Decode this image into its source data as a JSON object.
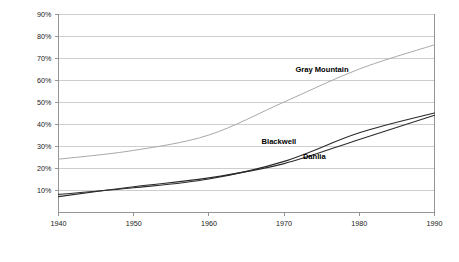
{
  "chart_data": {
    "type": "line",
    "title": "",
    "xlabel": "",
    "ylabel": "",
    "x": [
      1940,
      1950,
      1960,
      1970,
      1980,
      1990
    ],
    "xlim": [
      1940,
      1990
    ],
    "ylim": [
      0,
      90
    ],
    "xticks": [
      "1940",
      "1950",
      "1960",
      "1970",
      "1980",
      "1990"
    ],
    "yticks": [
      "10%",
      "20%",
      "30%",
      "40%",
      "50%",
      "60%",
      "70%",
      "80%",
      "90%"
    ],
    "ytick_values": [
      10,
      20,
      30,
      40,
      50,
      60,
      70,
      80,
      90
    ],
    "grid": true,
    "legend_position": "inline-annotations",
    "series": [
      {
        "name": "Gray Mountain",
        "color": "#a8a8a8",
        "values": [
          24,
          28,
          35,
          50,
          65,
          76
        ]
      },
      {
        "name": "Blackwell",
        "color": "#2b2b2b",
        "values": [
          8,
          11,
          15,
          23,
          36,
          45
        ]
      },
      {
        "name": "Dahlia",
        "color": "#2b2b2b",
        "values": [
          7,
          11.5,
          15.5,
          22,
          33,
          44
        ]
      }
    ],
    "annotations": [
      {
        "text": "Gray Mountain",
        "x": 1971.5,
        "y": 63.5
      },
      {
        "text": "Blackwell",
        "x": 1967.0,
        "y": 31.0
      },
      {
        "text": "Dahlia",
        "x": 1972.5,
        "y": 24.0
      }
    ],
    "colors": {
      "gridline": "#b9b9b9",
      "axis": "#8a8a8a",
      "text": "#1a1a1a",
      "background": "#ffffff"
    }
  }
}
